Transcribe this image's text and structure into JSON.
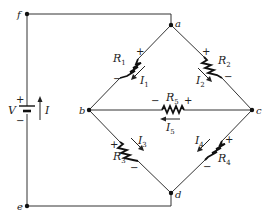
{
  "diagram": {
    "type": "circuit",
    "nodes": [
      {
        "id": "f",
        "label": "f",
        "x": 27,
        "y": 14
      },
      {
        "id": "a",
        "label": "a",
        "x": 171,
        "y": 25
      },
      {
        "id": "b",
        "label": "b",
        "x": 89,
        "y": 110
      },
      {
        "id": "c",
        "label": "c",
        "x": 252,
        "y": 110
      },
      {
        "id": "d",
        "label": "d",
        "x": 171,
        "y": 193
      },
      {
        "id": "e",
        "label": "e",
        "x": 27,
        "y": 206
      }
    ],
    "source": {
      "label": "V",
      "plus": "+",
      "minus": "−",
      "current_label": "I",
      "current_direction": "up"
    },
    "resistors": [
      {
        "id": "R1",
        "name": "R",
        "sub": "1",
        "between": [
          "a",
          "b"
        ],
        "plus_end": "a",
        "current": {
          "name": "I",
          "sub": "1",
          "direction": "a-to-b"
        }
      },
      {
        "id": "R2",
        "name": "R",
        "sub": "2",
        "between": [
          "a",
          "c"
        ],
        "plus_end": "a",
        "current": {
          "name": "I",
          "sub": "2",
          "direction": "a-to-c"
        }
      },
      {
        "id": "R3",
        "name": "R",
        "sub": "3",
        "between": [
          "b",
          "d"
        ],
        "plus_end": "b",
        "current": {
          "name": "I",
          "sub": "3",
          "direction": "b-to-d"
        }
      },
      {
        "id": "R4",
        "name": "R",
        "sub": "4",
        "between": [
          "c",
          "d"
        ],
        "plus_end": "c",
        "current": {
          "name": "I",
          "sub": "4",
          "direction": "c-to-d"
        }
      },
      {
        "id": "R5",
        "name": "R",
        "sub": "5",
        "between": [
          "b",
          "c"
        ],
        "plus_end": "c",
        "current": {
          "name": "I",
          "sub": "5",
          "direction": "c-to-b"
        }
      }
    ],
    "signs": {
      "plus": "+",
      "minus": "−"
    }
  }
}
